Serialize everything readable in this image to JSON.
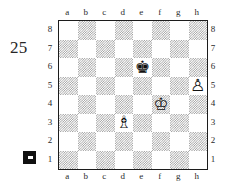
{
  "diagram": {
    "number": "25",
    "side_to_move_marker": "black-square",
    "side_to_move": "black"
  },
  "board": {
    "files": [
      "a",
      "b",
      "c",
      "d",
      "e",
      "f",
      "g",
      "h"
    ],
    "ranks": [
      "8",
      "7",
      "6",
      "5",
      "4",
      "3",
      "2",
      "1"
    ],
    "orientation": "white-bottom",
    "light_square_color": "#ffffff",
    "dark_square_color": "#9a9a9a",
    "border_color": "#1c1c1c",
    "pieces": [
      {
        "square": "e6",
        "file": "e",
        "rank": "6",
        "color": "black",
        "type": "king",
        "glyph": "♚",
        "name": "black-king"
      },
      {
        "square": "h5",
        "file": "h",
        "rank": "5",
        "color": "white",
        "type": "pawn",
        "glyph": "♙",
        "name": "white-pawn"
      },
      {
        "square": "f4",
        "file": "f",
        "rank": "4",
        "color": "white",
        "type": "king",
        "glyph": "♔",
        "name": "white-king"
      },
      {
        "square": "d3",
        "file": "d",
        "rank": "3",
        "color": "white",
        "type": "bishop",
        "glyph": "♗",
        "name": "white-bishop"
      }
    ],
    "fen": "8/8/4k3/7P/5K2/3B4/8/8 b - - 0 1"
  },
  "labels": {
    "files_top": [
      "a",
      "b",
      "c",
      "d",
      "e",
      "f",
      "g",
      "h"
    ],
    "files_bottom": [
      "a",
      "b",
      "c",
      "d",
      "e",
      "f",
      "g",
      "h"
    ],
    "ranks_left": [
      "8",
      "7",
      "6",
      "5",
      "4",
      "3",
      "2",
      "1"
    ],
    "ranks_right": [
      "8",
      "7",
      "6",
      "5",
      "4",
      "3",
      "2",
      "1"
    ]
  }
}
